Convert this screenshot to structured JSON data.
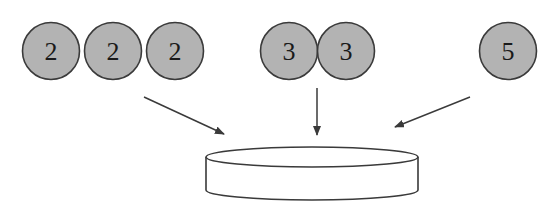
{
  "diagram": {
    "type": "grouping",
    "colors": {
      "circle_fill": "#b3b3b3",
      "circle_stroke": "#3a3a3a",
      "arrow": "#3a3a3a",
      "container_stroke": "#3a3a3a",
      "container_fill": "#ffffff"
    },
    "groups": [
      {
        "name": "twos",
        "items": [
          {
            "label": "2",
            "cx": 51,
            "cy": 51
          },
          {
            "label": "2",
            "cx": 113,
            "cy": 51
          },
          {
            "label": "2",
            "cx": 175,
            "cy": 51
          }
        ]
      },
      {
        "name": "threes",
        "items": [
          {
            "label": "3",
            "cx": 289,
            "cy": 51
          },
          {
            "label": "3",
            "cx": 346,
            "cy": 51
          }
        ]
      },
      {
        "name": "fives",
        "items": [
          {
            "label": "5",
            "cx": 508,
            "cy": 51
          }
        ]
      }
    ],
    "arrows": [
      {
        "from": [
          144,
          97
        ],
        "to": [
          224,
          134
        ]
      },
      {
        "from": [
          317,
          88
        ],
        "to": [
          317,
          135
        ]
      },
      {
        "from": [
          470,
          97
        ],
        "to": [
          395,
          127
        ]
      }
    ],
    "container": {
      "shape": "cylinder",
      "cx": 312,
      "top_cy": 157,
      "bottom_y": 190,
      "rx": 106,
      "ry": 10
    }
  }
}
